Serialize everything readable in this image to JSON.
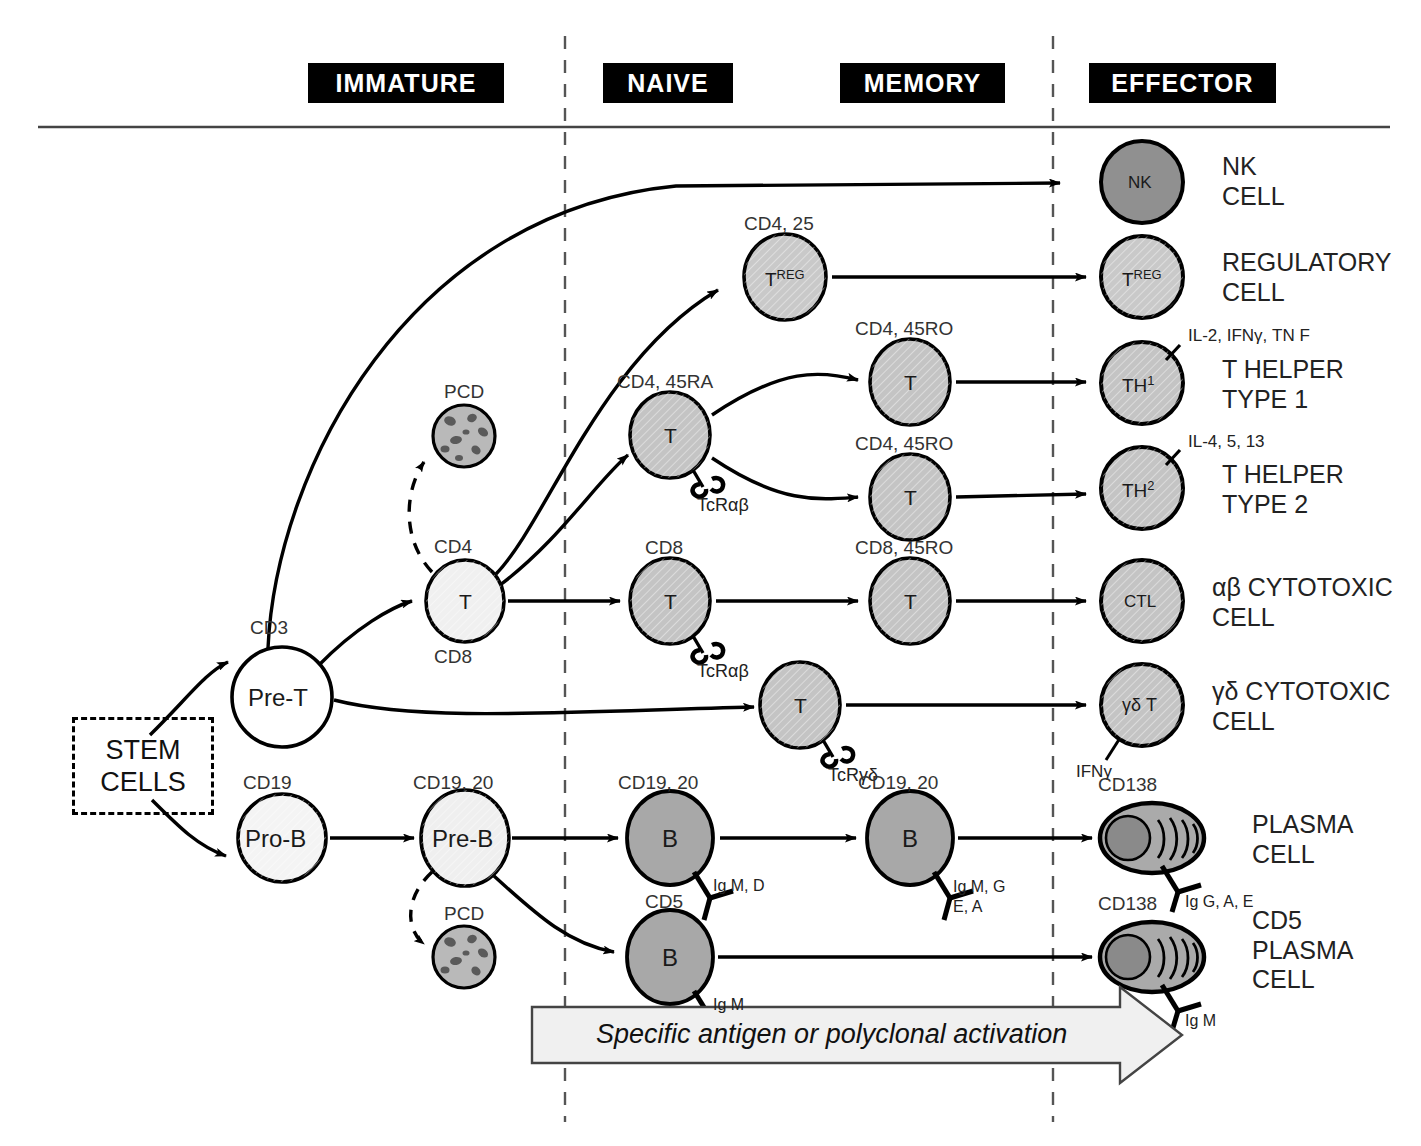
{
  "stages": [
    {
      "label": "IMMATURE",
      "x": 308,
      "y": 63,
      "w": 196
    },
    {
      "label": "NAIVE",
      "x": 603,
      "y": 63,
      "w": 130
    },
    {
      "label": "MEMORY",
      "x": 840,
      "y": 63,
      "w": 165
    },
    {
      "label": "EFFECTOR",
      "x": 1089,
      "y": 63,
      "w": 187
    }
  ],
  "dividers": {
    "x_positions": [
      565,
      1053
    ],
    "top": 36,
    "bottom": 1122,
    "style": "dashed"
  },
  "rule": {
    "y": 127,
    "x1": 38,
    "x2": 1390
  },
  "stem_box": {
    "line1": "STEM",
    "line2": "CELLS",
    "x": 72,
    "y": 717,
    "w": 136,
    "h": 92
  },
  "progenitors": [
    {
      "name": "pre-t-cell",
      "label": "Pre-T",
      "marker": "CD3",
      "cx": 282,
      "cy": 697,
      "r": 50,
      "fill": "#ffffff"
    },
    {
      "name": "pro-b-cell",
      "label": "Pro-B",
      "marker": "CD19",
      "cx": 282,
      "cy": 838,
      "r": 44,
      "fill": "#f4f4f4"
    }
  ],
  "immature": [
    {
      "name": "immature-t-cell",
      "label": "T",
      "marker_top": "CD4",
      "marker_bottom": "CD8",
      "cx": 465,
      "cy": 601,
      "rx": 39,
      "ry": 41,
      "fill": "#f0f0f0"
    },
    {
      "name": "pre-b-cell",
      "label": "Pre-B",
      "marker_top": "CD19, 20",
      "cx": 465,
      "cy": 838,
      "rx": 44,
      "ry": 48,
      "fill": "#efefef"
    }
  ],
  "pcd_cells": [
    {
      "name": "pcd-t",
      "label": "PCD",
      "cx": 464,
      "cy": 436,
      "r": 31,
      "fill": "#b9b9b9"
    },
    {
      "name": "pcd-b",
      "label": "PCD",
      "cx": 464,
      "cy": 957,
      "r": 31,
      "fill": "#b9b9b9"
    }
  ],
  "naive": [
    {
      "name": "naive-treg",
      "label": "T",
      "sup": "REG",
      "marker": "CD4, 25",
      "cx": 785,
      "cy": 277,
      "rx": 41,
      "ry": 43,
      "fill": "#c9c9c9",
      "receptor": null
    },
    {
      "name": "naive-cd4-t",
      "label": "T",
      "marker": "CD4, 45RA",
      "cx": 670,
      "cy": 435,
      "rx": 40,
      "ry": 43,
      "fill": "#c4c4c4",
      "receptor": "TcRαβ"
    },
    {
      "name": "naive-cd8-t",
      "label": "T",
      "marker": "CD8",
      "cx": 670,
      "cy": 601,
      "rx": 40,
      "ry": 43,
      "fill": "#c4c4c4",
      "receptor": "TcRαβ"
    },
    {
      "name": "naive-b",
      "label": "B",
      "marker": "CD19, 20",
      "cx": 670,
      "cy": 838,
      "rx": 43,
      "ry": 47,
      "fill": "#a8a8a8",
      "receptor": "Ig M, D"
    },
    {
      "name": "naive-cd5-b",
      "label": "B",
      "marker": "CD5",
      "cx": 670,
      "cy": 957,
      "rx": 43,
      "ry": 47,
      "fill": "#a8a8a8",
      "receptor": "Ig M"
    }
  ],
  "memory": [
    {
      "name": "memory-th1",
      "label": "T",
      "marker": "CD4, 45RO",
      "cx": 910,
      "cy": 382,
      "rx": 40,
      "ry": 43,
      "fill": "#c4c4c4",
      "receptor": null
    },
    {
      "name": "memory-th2",
      "label": "T",
      "marker": "CD4, 45RO",
      "cx": 910,
      "cy": 497,
      "rx": 40,
      "ry": 43,
      "fill": "#c4c4c4",
      "receptor": null
    },
    {
      "name": "memory-cd8-t",
      "label": "T",
      "marker": "CD8, 45RO",
      "cx": 910,
      "cy": 601,
      "rx": 40,
      "ry": 43,
      "fill": "#c4c4c4",
      "receptor": null
    },
    {
      "name": "memory-gd-t",
      "label": "T",
      "marker": "",
      "cx": 800,
      "cy": 705,
      "rx": 40,
      "ry": 43,
      "fill": "#c4c4c4",
      "receptor": "TcRγδ"
    },
    {
      "name": "memory-b",
      "label": "B",
      "marker": "CD19, 20",
      "cx": 910,
      "cy": 838,
      "rx": 43,
      "ry": 47,
      "fill": "#a8a8a8",
      "receptor": "Ig M, G|E, A"
    }
  ],
  "effectors": [
    {
      "name": "effector-nk",
      "inner": "NK",
      "lines": [
        "NK",
        "CELL"
      ],
      "cx": 1142,
      "cy": 182,
      "r": 41,
      "fill": "#909090",
      "cytokine": null,
      "shape": "circle"
    },
    {
      "name": "effector-treg",
      "inner": "T",
      "sup": "REG",
      "lines": [
        "REGULATORY",
        "CELL"
      ],
      "cx": 1142,
      "cy": 277,
      "r": 41,
      "fill": "#c9c9c9",
      "cytokine": null,
      "shape": "circle"
    },
    {
      "name": "effector-th1",
      "inner": "TH",
      "sup": "1",
      "lines": [
        "T HELPER",
        "TYPE 1"
      ],
      "cx": 1142,
      "cy": 383,
      "r": 41,
      "fill": "#c4c4c4",
      "cytokine": "IL-2, IFNγ, TN F",
      "shape": "circle"
    },
    {
      "name": "effector-th2",
      "inner": "TH",
      "sup": "2",
      "lines": [
        "T HELPER",
        "TYPE 2"
      ],
      "cx": 1142,
      "cy": 488,
      "r": 41,
      "fill": "#c4c4c4",
      "cytokine": "IL-4, 5, 13",
      "shape": "circle"
    },
    {
      "name": "effector-ctl",
      "inner": "CTL",
      "lines": [
        "αβ CYTOTOXIC",
        "CELL"
      ],
      "cx": 1142,
      "cy": 601,
      "r": 41,
      "fill": "#c4c4c4",
      "cytokine": null,
      "shape": "circle"
    },
    {
      "name": "effector-gd-t",
      "inner": "γδ T",
      "lines": [
        "γδ CYTOTOXIC",
        "CELL"
      ],
      "cx": 1142,
      "cy": 705,
      "r": 41,
      "fill": "#c4c4c4",
      "cytokine": "IFNγ",
      "shape": "circle"
    },
    {
      "name": "effector-plasma",
      "inner": "",
      "lines": [
        "PLASMA",
        "CELL"
      ],
      "cx": 1152,
      "cy": 838,
      "r": 46,
      "fill": "#aaaaaa",
      "marker_top": "CD138",
      "receptor": "Ig G, A, E",
      "shape": "plasma"
    },
    {
      "name": "effector-cd5-plasma",
      "inner": "",
      "lines": [
        "CD5",
        "PLASMA",
        "CELL"
      ],
      "cx": 1152,
      "cy": 957,
      "r": 46,
      "fill": "#aaaaaa",
      "marker_top": "CD138",
      "receptor": "Ig M",
      "shape": "plasma"
    }
  ],
  "banner": {
    "text": "Specific antigen or polyclonal activation",
    "x1": 532,
    "x2": 1120,
    "y": 1035,
    "h": 56,
    "fill": "#f0f0f0"
  },
  "colors": {
    "ink": "#000000",
    "nk_fill": "#909090",
    "b_fill": "#a8a8a8",
    "t_fill": "#c4c4c4",
    "immature_fill": "#f0f0f0",
    "pcd_fill": "#b9b9b9",
    "banner_fill": "#f0f0f0"
  }
}
